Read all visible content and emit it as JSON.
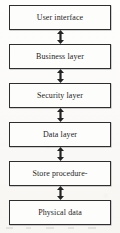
{
  "diagram": {
    "type": "layered-architecture-stack",
    "orientation": "vertical",
    "connector_style": "double-headed-arrow",
    "box_border_color": "#2e2e2e",
    "box_fill_color": "#fdfdfc",
    "text_color": "#1d1d1d",
    "background_color": "#fbfbf9",
    "layers": [
      {
        "id": "user-interface",
        "label": "User interface"
      },
      {
        "id": "business-layer",
        "label": "Business layer"
      },
      {
        "id": "security-layer",
        "label": "Security layer"
      },
      {
        "id": "data-layer",
        "label": "Data layer"
      },
      {
        "id": "store-procedure",
        "label": "Store procedure-"
      },
      {
        "id": "physical-data",
        "label": "Physical data"
      }
    ],
    "connectors": [
      {
        "id": "c1",
        "from": "user-interface",
        "to": "business-layer",
        "bidirectional": true
      },
      {
        "id": "c2",
        "from": "business-layer",
        "to": "security-layer",
        "bidirectional": true
      },
      {
        "id": "c3",
        "from": "security-layer",
        "to": "data-layer",
        "bidirectional": true
      },
      {
        "id": "c4",
        "from": "data-layer",
        "to": "store-procedure",
        "bidirectional": true
      },
      {
        "id": "c5",
        "from": "store-procedure",
        "to": "physical-data",
        "bidirectional": true
      }
    ]
  }
}
